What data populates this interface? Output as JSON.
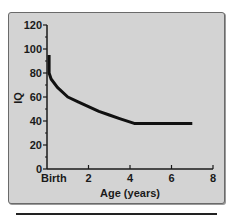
{
  "chart_data": {
    "type": "line",
    "title": "",
    "xlabel": "Age (years)",
    "ylabel": "IQ",
    "xlim": [
      0,
      8
    ],
    "ylim": [
      0,
      120
    ],
    "x_ticks": [
      0,
      2,
      4,
      6,
      8
    ],
    "x_tick_labels": [
      "Birth",
      "2",
      "4",
      "6",
      "8"
    ],
    "y_ticks": [
      0,
      20,
      40,
      60,
      80,
      100,
      120
    ],
    "y_tick_labels": [
      "0",
      "20",
      "40",
      "60",
      "80",
      "100",
      "120"
    ],
    "grid": false,
    "legend": null,
    "series": [
      {
        "name": "IQ",
        "color": "#111111",
        "x": [
          0.1,
          0.1,
          0.2,
          0.5,
          1.0,
          1.5,
          2.0,
          2.5,
          3.0,
          3.5,
          4.2,
          5.0,
          6.0,
          7.0
        ],
        "values": [
          95,
          80,
          75,
          68,
          60,
          56,
          52,
          48,
          45,
          42,
          38,
          38,
          38,
          38
        ]
      }
    ]
  },
  "colors": {
    "panel_bg": "#d3d3d3",
    "panel_border": "#6a6a6a",
    "line": "#111111",
    "text": "#1a1a1a"
  }
}
